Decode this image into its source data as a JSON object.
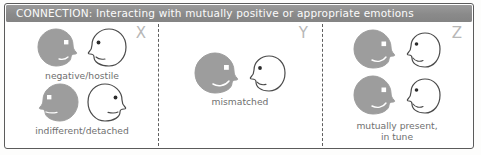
{
  "figure": {
    "title_banner": "CONNECTION: Interacting with mutually positive or appropriate emotions",
    "banner_color": "#8e8e8e",
    "banner_text_color": "#fbfbfb",
    "head_fill_gray": "#9d9d9d",
    "head_outline": "#4a4a4a",
    "caption_color": "#6f6f6f",
    "mark_color": "#b7b7b7"
  },
  "panels": [
    {
      "mark": "X",
      "groups": [
        {
          "caption": "negative/hostile",
          "left_face": {
            "fill": "gray",
            "facing": "right",
            "expression": "frown"
          },
          "right_face": {
            "fill": "white",
            "facing": "left",
            "expression": "frown"
          }
        },
        {
          "caption": "indifferent/detached",
          "left_face": {
            "fill": "gray",
            "facing": "left",
            "expression": "flat"
          },
          "right_face": {
            "fill": "white",
            "facing": "right",
            "expression": "flat"
          }
        }
      ]
    },
    {
      "mark": "Y",
      "groups": [
        {
          "caption": "mismatched",
          "left_face": {
            "fill": "gray",
            "facing": "right",
            "expression": "smile"
          },
          "right_face": {
            "fill": "white",
            "facing": "left",
            "expression": "frown"
          }
        }
      ]
    },
    {
      "mark": "Z",
      "groups": [
        {
          "caption": "mutually present,\nin tune",
          "left_face": {
            "fill": "gray",
            "facing": "right",
            "expression": "smile"
          },
          "right_face": {
            "fill": "white",
            "facing": "left",
            "expression": "smile"
          }
        },
        {
          "caption": "",
          "left_face": {
            "fill": "gray",
            "facing": "right",
            "expression": "smile"
          },
          "right_face": {
            "fill": "white",
            "facing": "left",
            "expression": "smile"
          }
        }
      ]
    }
  ]
}
